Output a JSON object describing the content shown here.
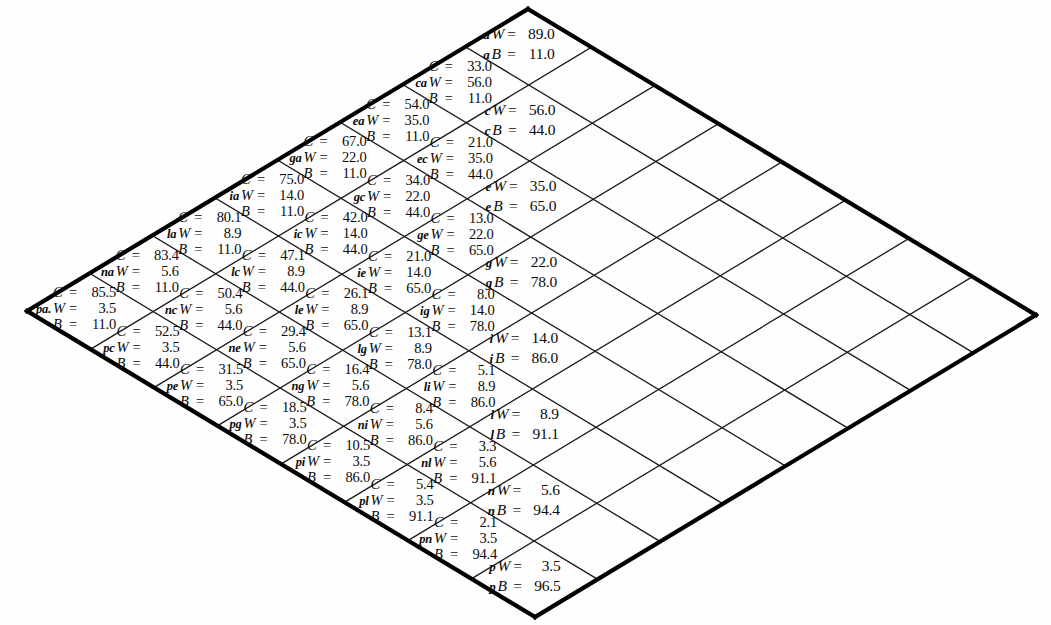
{
  "figure": {
    "type": "lattice-diamond-grid",
    "grid_size": 8,
    "rotation_deg": 45,
    "background_color": "#fefefe",
    "line_color": "#1a1a1a",
    "border_color": "#000000",
    "symbols": {
      "C": "C",
      "W": "W",
      "B": "B",
      "equals": "="
    }
  },
  "cells": [
    {
      "row": 0,
      "col": 0,
      "tag": "a",
      "kind": "diagonal",
      "W": "89.0",
      "B": "11.0"
    },
    {
      "row": 1,
      "col": 0,
      "tag": "ca",
      "kind": "off",
      "C": "33.0",
      "W": "56.0",
      "B": "11.0"
    },
    {
      "row": 1,
      "col": 1,
      "tag": "c",
      "kind": "diagonal",
      "W": "56.0",
      "B": "44.0"
    },
    {
      "row": 2,
      "col": 0,
      "tag": "ea",
      "kind": "off",
      "C": "54.0",
      "W": "35.0",
      "B": "11.0"
    },
    {
      "row": 2,
      "col": 1,
      "tag": "ec",
      "kind": "off",
      "C": "21.0",
      "W": "35.0",
      "B": "44.0"
    },
    {
      "row": 2,
      "col": 2,
      "tag": "e",
      "kind": "diagonal",
      "W": "35.0",
      "B": "65.0"
    },
    {
      "row": 3,
      "col": 0,
      "tag": "ga",
      "kind": "off",
      "C": "67.0",
      "W": "22.0",
      "B": "11.0"
    },
    {
      "row": 3,
      "col": 1,
      "tag": "gc",
      "kind": "off",
      "C": "34.0",
      "W": "22.0",
      "B": "44.0"
    },
    {
      "row": 3,
      "col": 2,
      "tag": "ge",
      "kind": "off",
      "C": "13.0",
      "W": "22.0",
      "B": "65.0"
    },
    {
      "row": 3,
      "col": 3,
      "tag": "g",
      "kind": "diagonal",
      "W": "22.0",
      "B": "78.0"
    },
    {
      "row": 4,
      "col": 0,
      "tag": "ia",
      "kind": "off",
      "C": "75.0",
      "W": "14.0",
      "B": "11.0"
    },
    {
      "row": 4,
      "col": 1,
      "tag": "ic",
      "kind": "off",
      "C": "42.0",
      "W": "14.0",
      "B": "44.0"
    },
    {
      "row": 4,
      "col": 2,
      "tag": "ie",
      "kind": "off",
      "C": "21.0",
      "W": "14.0",
      "B": "65.0"
    },
    {
      "row": 4,
      "col": 3,
      "tag": "ig",
      "kind": "off",
      "C": "8.0",
      "W": "14.0",
      "B": "78.0"
    },
    {
      "row": 4,
      "col": 4,
      "tag": "i",
      "kind": "diagonal",
      "W": "14.0",
      "B": "86.0"
    },
    {
      "row": 5,
      "col": 0,
      "tag": "la",
      "kind": "off",
      "C": "80.1",
      "W": "8.9",
      "B": "11.0"
    },
    {
      "row": 5,
      "col": 1,
      "tag": "lc",
      "kind": "off",
      "C": "47.1",
      "W": "8.9",
      "B": "44.0"
    },
    {
      "row": 5,
      "col": 2,
      "tag": "le",
      "kind": "off",
      "C": "26.1",
      "W": "8.9",
      "B": "65.0"
    },
    {
      "row": 5,
      "col": 3,
      "tag": "lg",
      "kind": "off",
      "C": "13.1",
      "W": "8.9",
      "B": "78.0"
    },
    {
      "row": 5,
      "col": 4,
      "tag": "li",
      "kind": "off",
      "C": "5.1",
      "W": "8.9",
      "B": "86.0"
    },
    {
      "row": 5,
      "col": 5,
      "tag": "l",
      "kind": "diagonal",
      "W": "8.9",
      "B": "91.1"
    },
    {
      "row": 6,
      "col": 0,
      "tag": "na",
      "kind": "off",
      "C": "83.4",
      "W": "5.6",
      "B": "11.0"
    },
    {
      "row": 6,
      "col": 1,
      "tag": "nc",
      "kind": "off",
      "C": "50.4",
      "W": "5.6",
      "B": "44.0"
    },
    {
      "row": 6,
      "col": 2,
      "tag": "ne",
      "kind": "off",
      "C": "29.4",
      "W": "5.6",
      "B": "65.0"
    },
    {
      "row": 6,
      "col": 3,
      "tag": "ng",
      "kind": "off",
      "C": "16.4",
      "W": "5.6",
      "B": "78.0"
    },
    {
      "row": 6,
      "col": 4,
      "tag": "ni",
      "kind": "off",
      "C": "8.4",
      "W": "5.6",
      "B": "86.0"
    },
    {
      "row": 6,
      "col": 5,
      "tag": "nl",
      "kind": "off",
      "C": "3.3",
      "W": "5.6",
      "B": "91.1"
    },
    {
      "row": 6,
      "col": 6,
      "tag": "n",
      "kind": "diagonal",
      "W": "5.6",
      "B": "94.4"
    },
    {
      "row": 7,
      "col": 0,
      "tag": "pa.",
      "kind": "off",
      "C": "85.5",
      "W": "3.5",
      "B": "11.0"
    },
    {
      "row": 7,
      "col": 1,
      "tag": "pc",
      "kind": "off",
      "C": "52.5",
      "W": "3.5",
      "B": "44.0"
    },
    {
      "row": 7,
      "col": 2,
      "tag": "pe",
      "kind": "off",
      "C": "31.5",
      "W": "3.5",
      "B": "65.0"
    },
    {
      "row": 7,
      "col": 3,
      "tag": "pg",
      "kind": "off",
      "C": "18.5",
      "W": "3.5",
      "B": "78.0"
    },
    {
      "row": 7,
      "col": 4,
      "tag": "pi",
      "kind": "off",
      "C": "10.5",
      "W": "3.5",
      "B": "86.0"
    },
    {
      "row": 7,
      "col": 5,
      "tag": "pl",
      "kind": "off",
      "C": "5.4",
      "W": "3.5",
      "B": "91.1"
    },
    {
      "row": 7,
      "col": 6,
      "tag": "pn",
      "kind": "off",
      "C": "2.1",
      "W": "3.5",
      "B": "94.4"
    },
    {
      "row": 7,
      "col": 7,
      "tag": "p",
      "kind": "diagonal",
      "W": "3.5",
      "B": "96.5"
    }
  ]
}
